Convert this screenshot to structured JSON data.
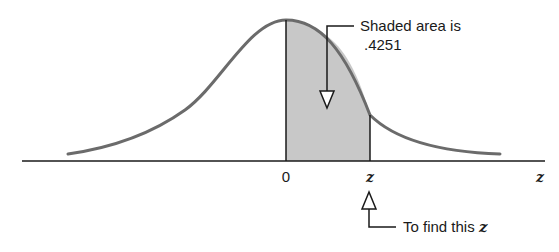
{
  "diagram": {
    "type": "standard-normal-curve-shaded-area",
    "callouts": {
      "shaded_area_line1": "Shaded area is",
      "shaded_area_value": ".4251",
      "find_z_prefix": "To find this ",
      "find_z_var": "z"
    },
    "axis": {
      "zero_label": "0",
      "z_tick_label": "z",
      "axis_end_label": "z"
    },
    "colors": {
      "curve": "#6b6b6b",
      "shade": "#c8c8c8",
      "lines": "#1a1a1a",
      "background": "#ffffff"
    }
  }
}
